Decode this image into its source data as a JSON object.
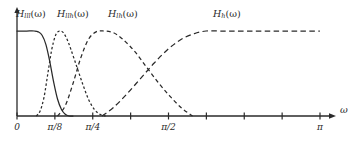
{
  "figure": {
    "background_color": "#ffffff",
    "line_color": "#2a2a2a",
    "axis_label": "ω",
    "x_axis": {
      "label": "ω",
      "range_start": 0,
      "range_end": 3.14159,
      "tick_values": [
        0,
        0.3927,
        0.7854,
        1.1781,
        1.5708,
        1.9635,
        2.3562,
        2.7489,
        3.14159
      ],
      "tick_labels": [
        "0",
        "π/8",
        "π/4",
        "",
        "π/2",
        "",
        "",
        "",
        "π"
      ],
      "labeled_ticks": [
        {
          "value": 0,
          "text": "0"
        },
        {
          "value": 0.3927,
          "text": "π/8"
        },
        {
          "value": 0.7854,
          "text": "π/4"
        },
        {
          "value": 1.5708,
          "text": "π/2"
        },
        {
          "value": 3.14159,
          "text": "π"
        }
      ]
    },
    "y_axis": {
      "plateau_value": 1,
      "baseline_value": 0
    },
    "curve_labels": [
      {
        "base": "H",
        "sub": "lll",
        "arg": "(ω)",
        "x": 16,
        "y": 8
      },
      {
        "base": "H",
        "sub": "llh",
        "arg": "(ω)",
        "x": 57,
        "y": 8
      },
      {
        "base": "H",
        "sub": "lh",
        "arg": "(ω)",
        "x": 108,
        "y": 8
      },
      {
        "base": "H",
        "sub": "h",
        "arg": "(ω)",
        "x": 213,
        "y": 8
      }
    ]
  },
  "chart_data": {
    "type": "line",
    "title": "",
    "xlabel": "ω",
    "ylabel": "",
    "xlim": [
      0,
      3.14159
    ],
    "ylim": [
      0,
      1.15
    ],
    "grid": false,
    "legend_position": "above-curves",
    "x_ticks": [
      0,
      0.3927,
      0.7854,
      1.5708,
      3.14159
    ],
    "x_tick_labels": [
      "0",
      "π/8",
      "π/4",
      "π/2",
      "π"
    ],
    "series": [
      {
        "name": "H_lll(ω)",
        "label": "H_{lll}(ω)",
        "style": "solid",
        "description": "lowpass, flat passband then rolloff",
        "x": [
          0.0,
          0.1,
          0.18,
          0.22,
          0.26,
          0.3,
          0.34,
          0.38,
          0.42,
          0.46,
          0.5,
          0.54,
          0.58
        ],
        "values": [
          1.0,
          1.0,
          1.0,
          0.99,
          0.95,
          0.84,
          0.64,
          0.4,
          0.2,
          0.08,
          0.02,
          0.0,
          0.0
        ]
      },
      {
        "name": "H_llh(ω)",
        "label": "H_{llh}(ω)",
        "style": "dashed-fine",
        "description": "narrow bandpass centered near π/8",
        "x": [
          0.2,
          0.24,
          0.28,
          0.32,
          0.36,
          0.4,
          0.44,
          0.48,
          0.52,
          0.56,
          0.62,
          0.68,
          0.74,
          0.8,
          0.86,
          0.92
        ],
        "values": [
          0.0,
          0.06,
          0.22,
          0.5,
          0.78,
          0.95,
          1.0,
          0.98,
          0.9,
          0.78,
          0.58,
          0.38,
          0.2,
          0.08,
          0.02,
          0.0
        ]
      },
      {
        "name": "H_lh(ω)",
        "label": "H_{lh}(ω)",
        "style": "dashed",
        "description": "wider bandpass with flat top near π/4",
        "x": [
          0.42,
          0.5,
          0.58,
          0.66,
          0.74,
          0.82,
          0.9,
          1.0,
          1.1,
          1.22,
          1.34,
          1.46,
          1.58,
          1.7,
          1.82
        ],
        "values": [
          0.0,
          0.12,
          0.38,
          0.68,
          0.9,
          0.99,
          1.0,
          0.98,
          0.9,
          0.76,
          0.58,
          0.4,
          0.24,
          0.1,
          0.0
        ]
      },
      {
        "name": "H_h(ω)",
        "label": "H_{h}(ω)",
        "style": "dashed-long",
        "description": "highpass rising to flat plateau up to π",
        "x": [
          0.88,
          1.0,
          1.14,
          1.28,
          1.42,
          1.56,
          1.7,
          1.84,
          1.96,
          2.08,
          2.2,
          2.45,
          2.7,
          2.95,
          3.14
        ],
        "values": [
          0.0,
          0.1,
          0.26,
          0.44,
          0.62,
          0.78,
          0.9,
          0.97,
          1.0,
          1.0,
          1.0,
          1.0,
          1.0,
          1.0,
          1.0
        ]
      }
    ]
  }
}
